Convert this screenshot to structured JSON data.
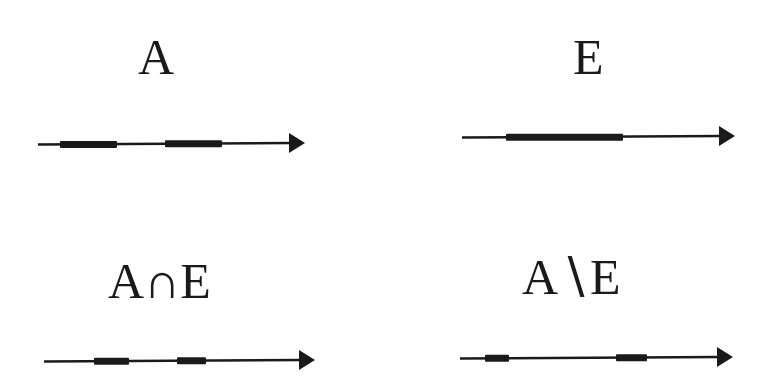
{
  "colors": {
    "ink": "#1a1a1a",
    "background": "#ffffff"
  },
  "panels": [
    {
      "id": "A",
      "label": "A",
      "label_pos": {
        "x": 138,
        "y": 32
      },
      "line": {
        "x1": 38,
        "x2": 305,
        "y": 143
      },
      "segments": [
        [
          60,
          117
        ],
        [
          165,
          222
        ]
      ]
    },
    {
      "id": "E",
      "label": "E",
      "label_pos": {
        "x": 573,
        "y": 32
      },
      "line": {
        "x1": 462,
        "x2": 735,
        "y": 136
      },
      "segments": [
        [
          506,
          623
        ]
      ]
    },
    {
      "id": "A-intersect-E",
      "label": "A∩E",
      "label_pos": {
        "x": 108,
        "y": 256
      },
      "line": {
        "x1": 44,
        "x2": 315,
        "y": 360
      },
      "segments": [
        [
          94,
          129
        ],
        [
          177,
          206
        ]
      ]
    },
    {
      "id": "A-minus-E",
      "label": "A∖E",
      "label_pos": {
        "x": 522,
        "y": 252
      },
      "line": {
        "x1": 460,
        "x2": 733,
        "y": 357
      },
      "segments": [
        [
          485,
          509
        ],
        [
          616,
          647
        ]
      ]
    }
  ]
}
